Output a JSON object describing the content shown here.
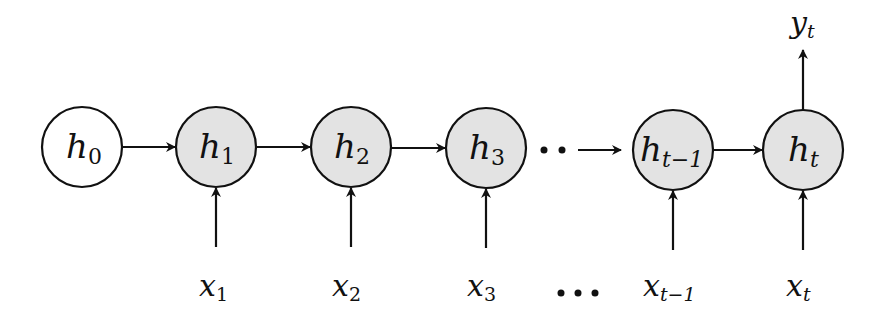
{
  "diagram": {
    "colors": {
      "initial_fill": "#ffffff",
      "hidden_fill": "#e3e3e3",
      "stroke": "#111111"
    },
    "nodes": [
      {
        "id": "h0",
        "base": "h",
        "sub": "0",
        "cx": 82,
        "cy": 147,
        "fill": "initial"
      },
      {
        "id": "h1",
        "base": "h",
        "sub": "1",
        "cx": 216,
        "cy": 147,
        "fill": "hidden"
      },
      {
        "id": "h2",
        "base": "h",
        "sub": "2",
        "cx": 351,
        "cy": 147,
        "fill": "hidden"
      },
      {
        "id": "h3",
        "base": "h",
        "sub": "3",
        "cx": 486,
        "cy": 148,
        "fill": "hidden"
      },
      {
        "id": "ht-1",
        "base": "h",
        "sub": "t−1",
        "cx": 673,
        "cy": 150,
        "fill": "hidden"
      },
      {
        "id": "ht",
        "base": "h",
        "sub": "t",
        "cx": 803,
        "cy": 150,
        "fill": "hidden"
      }
    ],
    "inputs": [
      {
        "base": "x",
        "sub": "1",
        "x": 216
      },
      {
        "base": "x",
        "sub": "2",
        "x": 351
      },
      {
        "base": "x",
        "sub": "3",
        "x": 486
      },
      {
        "base": "x",
        "sub": "t−1",
        "x": 673
      },
      {
        "base": "x",
        "sub": "t",
        "x": 803
      }
    ],
    "output": {
      "base": "y",
      "sub": "t",
      "x": 803
    },
    "ellipsis_top": "··",
    "ellipsis_bottom": "•••",
    "edges": [
      [
        "h0",
        "h1"
      ],
      [
        "h1",
        "h2"
      ],
      [
        "h2",
        "h3"
      ],
      [
        "dots",
        "ht-1"
      ],
      [
        "ht-1",
        "ht"
      ]
    ]
  }
}
